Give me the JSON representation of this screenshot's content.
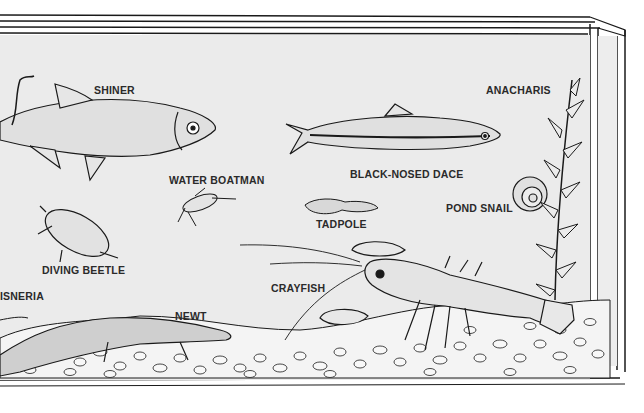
{
  "diagram": {
    "labels": {
      "shiner": "SHINER",
      "water_boatman": "WATER BOATMAN",
      "black_nosed_dace": "BLACK-NOSED DACE",
      "anacharis": "ANACHARIS",
      "tadpole": "TADPOLE",
      "pond_snail": "POND SNAIL",
      "diving_beetle": "DIVING BEETLE",
      "vallisneria": "ISNERIA",
      "crayfish": "CRAYFISH",
      "newt": "NEWT"
    },
    "colors": {
      "water": "#ebebeb",
      "ink": "#1a1a1a",
      "gravel": "#f4f4f4",
      "frame": "#ffffff"
    }
  }
}
